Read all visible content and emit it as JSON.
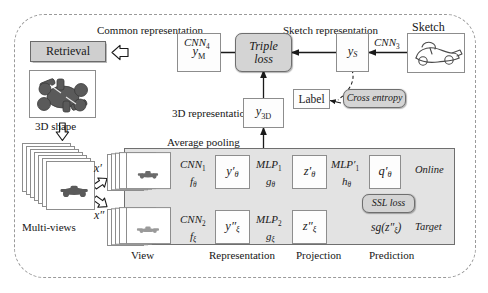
{
  "figure": {
    "type": "diagram"
  },
  "outer": {
    "style": "dashed-rounded-frame"
  },
  "top_row": {
    "common_representation_label": "Common representation",
    "sketch_representation_label": "Sketch representation",
    "sketch_label": "Sketch",
    "retrieval_label": "Retrieval",
    "y_m_label": "y",
    "y_m_sub": "M",
    "cnn4_label": "CNN",
    "cnn4_sub": "4",
    "triple_loss_line1": "Triple",
    "triple_loss_line2": "loss",
    "y_s_label": "y",
    "y_s_sub": "S",
    "cnn3_label": "CNN",
    "cnn3_sub": "3",
    "label_box": "Label",
    "cross_entropy_label": "Cross entropy"
  },
  "middle": {
    "three_d_representation_label": "3D representation",
    "y_3d_label": "y",
    "y_3d_sub": "3D",
    "average_pooling_label": "Average pooling",
    "three_d_shape_label": "3D shape",
    "multi_views_label": "Multi-views",
    "x_prime": "x′",
    "x_double_prime": "x″"
  },
  "ssl_panel": {
    "online_label": "Online",
    "target_label": "Target",
    "ssl_loss_label": "SSL loss",
    "stop_gradient_marker": "∕∕",
    "online_branch": {
      "cnn_label": "CNN",
      "cnn_sub": "1",
      "cnn_fn": "f",
      "cnn_fn_sub": "θ",
      "rep_label": "y′",
      "rep_sub": "θ",
      "mlp_label": "MLP",
      "mlp_sub": "1",
      "mlp_fn": "g",
      "mlp_fn_sub": "θ",
      "proj_label": "z′",
      "proj_sub": "θ",
      "mlp2_label": "MLP′",
      "mlp2_sub": "1",
      "mlp2_fn": "h",
      "mlp2_fn_sub": "θ",
      "pred_label": "q′",
      "pred_sub": "θ"
    },
    "target_branch": {
      "cnn_label": "CNN",
      "cnn_sub": "2",
      "cnn_fn": "f",
      "cnn_fn_sub": "ξ",
      "rep_label": "y″",
      "rep_sub": "ξ",
      "mlp_label": "MLP",
      "mlp_sub": "2",
      "mlp_fn": "g",
      "mlp_fn_sub": "ξ",
      "proj_label": "z″",
      "proj_sub": "ξ",
      "pred_label": "sg(z″",
      "pred_sub": "ξ",
      "pred_tail": ")"
    },
    "stage_captions": [
      "View",
      "Representation",
      "Projection",
      "Prediction"
    ]
  },
  "colors": {
    "frame_dashed": "#9a9a9a",
    "box_border": "#8d8d8d",
    "pill_fill": "#d4d4d4",
    "pill_border": "#6e6e6e",
    "panel_fill": "#e3e3e3",
    "panel_border": "#6f6f6f",
    "retrieval_fill": "#cfcfcf",
    "text": "#1a1a1a",
    "arrow": "#1a1a1a"
  }
}
